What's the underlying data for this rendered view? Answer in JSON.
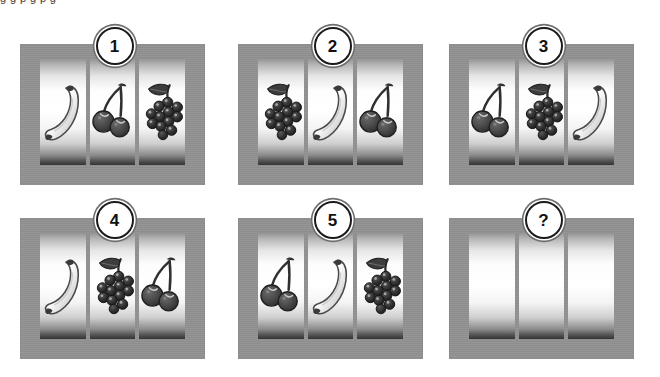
{
  "page": {
    "top_cut_text": "g g p g  p  g",
    "background_color": "#ffffff",
    "cabinet_color": "#929292",
    "badge_text_color": "#111111",
    "badge_ring_color": "#1b1b1b",
    "symbol_dark_color": "#333333",
    "symbol_light_color": "#e8e8e8"
  },
  "symbols": {
    "banana": "banana-symbol",
    "cherries": "cherries-symbol",
    "grapes": "grapes-symbol",
    "blank": "blank-symbol"
  },
  "machines": [
    {
      "badge": "1",
      "reels": [
        "banana",
        "cherries",
        "grapes"
      ]
    },
    {
      "badge": "2",
      "reels": [
        "grapes",
        "banana",
        "cherries"
      ]
    },
    {
      "badge": "3",
      "reels": [
        "cherries",
        "grapes",
        "banana"
      ]
    },
    {
      "badge": "4",
      "reels": [
        "banana",
        "grapes",
        "cherries"
      ]
    },
    {
      "badge": "5",
      "reels": [
        "cherries",
        "banana",
        "grapes"
      ]
    },
    {
      "badge": "?",
      "reels": [
        "blank",
        "blank",
        "blank"
      ]
    }
  ]
}
